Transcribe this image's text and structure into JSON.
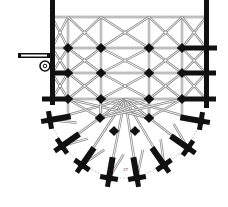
{
  "diagram": {
    "type": "architectural-floor-plan",
    "colors": {
      "ink": "#111111",
      "rib": "#8a8a8a",
      "rib_light": "#bdbdbd",
      "background": "#ffffff"
    },
    "walls": {
      "left": {
        "x": 50,
        "y1": 17,
        "y2": 122,
        "w": 5
      },
      "right": {
        "x": 204,
        "y1": 17,
        "y2": 125,
        "w": 5
      },
      "spur": {
        "x1": 18,
        "y1": 53,
        "x2": 50,
        "y2": 58
      }
    },
    "stair_turret": {
      "cx": 45,
      "cy": 66,
      "r": 5
    },
    "column_lines_x": [
      68,
      101,
      149,
      182
    ],
    "row_lines_y": [
      48,
      73,
      99
    ],
    "piers": [
      [
        68,
        48
      ],
      [
        101,
        48
      ],
      [
        149,
        48
      ],
      [
        182,
        48
      ],
      [
        68,
        73
      ],
      [
        101,
        73
      ],
      [
        149,
        73
      ],
      [
        182,
        73
      ],
      [
        68,
        99
      ],
      [
        101,
        99
      ],
      [
        149,
        99
      ],
      [
        182,
        99
      ],
      [
        100,
        118
      ],
      [
        149,
        118
      ],
      [
        114,
        131
      ],
      [
        135,
        131
      ]
    ],
    "side_buttresses": [
      {
        "x1": 50,
        "y": 73,
        "x2": 68
      },
      {
        "x1": 42,
        "y": 99,
        "x2": 68
      },
      {
        "x1": 182,
        "y": 48,
        "x2": 217
      },
      {
        "x1": 182,
        "y": 73,
        "x2": 216
      },
      {
        "x1": 182,
        "y": 99,
        "x2": 216
      }
    ],
    "radial_buttresses": [
      {
        "x": 50,
        "y": 120,
        "angle": -10
      },
      {
        "x": 62,
        "y": 146,
        "angle": -35
      },
      {
        "x": 82,
        "y": 165,
        "angle": -55
      },
      {
        "x": 109,
        "y": 178,
        "angle": -80
      },
      {
        "x": 137,
        "y": 178,
        "angle": -100
      },
      {
        "x": 164,
        "y": 165,
        "angle": -125
      },
      {
        "x": 188,
        "y": 148,
        "angle": -145
      },
      {
        "x": 201,
        "y": 121,
        "angle": -170
      }
    ],
    "annotation": "37"
  }
}
